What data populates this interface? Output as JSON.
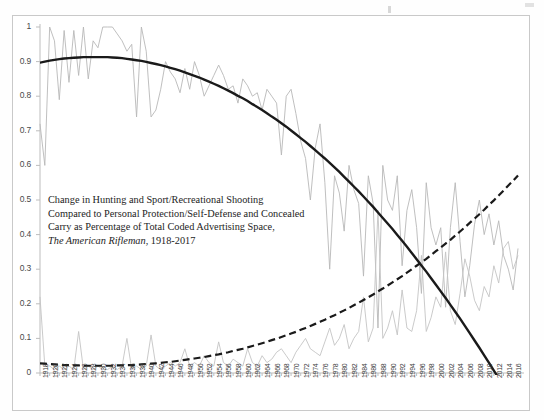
{
  "caption": {
    "line1": "Change in Hunting and Sport/Recreational Shooting",
    "line2": "Compared to Personal Protection/Self-Defense and Concealed",
    "line3": "Carry as Percentage of Total Coded Advertising Space,",
    "line4_italic": "The American Rifleman",
    "line4_rest": ", 1918-2017"
  },
  "chart_data": {
    "type": "line",
    "xlabel": "",
    "ylabel": "",
    "ylim": [
      0,
      1
    ],
    "xlim": [
      1918,
      2017
    ],
    "grid": false,
    "legend_position": "none",
    "ytick_labels": [
      "0",
      "0.1",
      "0.2",
      "0.3",
      "0.4",
      "0.5",
      "0.6",
      "0.7",
      "0.8",
      "0.9",
      "1"
    ],
    "ytick_values": [
      0,
      0.1,
      0.2,
      0.3,
      0.4,
      0.5,
      0.6,
      0.7,
      0.8,
      0.9,
      1
    ],
    "xtick_labels": [
      "1918",
      "1920",
      "1922",
      "1924",
      "1926",
      "1928",
      "1930",
      "1932",
      "1934",
      "1936",
      "1938",
      "1940",
      "1942",
      "1944",
      "1946",
      "1948",
      "1950",
      "1952",
      "1954",
      "1956",
      "1958",
      "1960",
      "1962",
      "1964",
      "1966",
      "1968",
      "1970",
      "1972",
      "1974",
      "1976",
      "1978",
      "1980",
      "1982",
      "1984",
      "1986",
      "1988",
      "1990",
      "1992",
      "1994",
      "1996",
      "1998",
      "2000",
      "2002",
      "2004",
      "2006",
      "2008",
      "2010",
      "2012",
      "2014",
      "2016"
    ],
    "x": [
      1918,
      1919,
      1920,
      1921,
      1922,
      1923,
      1924,
      1925,
      1926,
      1927,
      1928,
      1929,
      1930,
      1931,
      1932,
      1933,
      1934,
      1935,
      1936,
      1937,
      1938,
      1939,
      1940,
      1941,
      1942,
      1943,
      1944,
      1945,
      1946,
      1947,
      1948,
      1949,
      1950,
      1951,
      1952,
      1953,
      1954,
      1955,
      1956,
      1957,
      1958,
      1959,
      1960,
      1961,
      1962,
      1963,
      1964,
      1965,
      1966,
      1967,
      1968,
      1969,
      1970,
      1971,
      1972,
      1973,
      1974,
      1975,
      1976,
      1977,
      1978,
      1979,
      1980,
      1981,
      1982,
      1983,
      1984,
      1985,
      1986,
      1987,
      1988,
      1989,
      1990,
      1991,
      1992,
      1993,
      1994,
      1995,
      1996,
      1997,
      1998,
      1999,
      2000,
      2001,
      2002,
      2003,
      2004,
      2005,
      2006,
      2007,
      2008,
      2009,
      2010,
      2011,
      2012,
      2013,
      2014,
      2015,
      2016,
      2017
    ],
    "series": [
      {
        "name": "Hunting and Sport/Recreational Shooting",
        "style": "thin-solid-grey",
        "color": "#b8b8b8",
        "values": [
          0.72,
          0.6,
          1.0,
          0.96,
          0.79,
          0.99,
          0.84,
          0.99,
          0.86,
          1.0,
          0.85,
          0.96,
          0.94,
          1.0,
          1.0,
          1.0,
          0.98,
          0.96,
          0.93,
          0.95,
          0.74,
          1.0,
          0.93,
          0.74,
          0.76,
          0.82,
          0.9,
          0.87,
          0.85,
          0.81,
          0.88,
          0.82,
          0.9,
          0.86,
          0.8,
          0.83,
          0.86,
          0.89,
          0.86,
          0.82,
          0.83,
          0.78,
          0.85,
          0.83,
          0.8,
          0.81,
          0.76,
          0.82,
          0.8,
          0.78,
          0.63,
          0.8,
          0.82,
          0.75,
          0.67,
          0.62,
          0.5,
          0.65,
          0.72,
          0.55,
          0.3,
          0.57,
          0.52,
          0.41,
          0.6,
          0.53,
          0.49,
          0.28,
          0.57,
          0.49,
          0.13,
          0.6,
          0.5,
          0.47,
          0.57,
          0.31,
          0.47,
          0.53,
          0.42,
          0.23,
          0.55,
          0.42,
          0.37,
          0.42,
          0.19,
          0.42,
          0.55,
          0.38,
          0.22,
          0.31,
          0.43,
          0.5,
          0.4,
          0.46,
          0.37,
          0.44,
          0.34,
          0.3,
          0.24,
          0.36
        ]
      },
      {
        "name": "Personal Protection/Self-Defense and Concealed Carry",
        "style": "thin-solid-grey",
        "color": "#c4c4c4",
        "values": [
          0.22,
          0.02,
          0.02,
          0.01,
          0.02,
          0.01,
          0.02,
          0.01,
          0.12,
          0.01,
          0.02,
          0.01,
          0.02,
          0.01,
          0.01,
          0.02,
          0.01,
          0.02,
          0.1,
          0.01,
          0.02,
          0.01,
          0.02,
          0.11,
          0.02,
          0.01,
          0.02,
          0.03,
          0.02,
          0.03,
          0.07,
          0.02,
          0.03,
          0.02,
          0.05,
          0.03,
          0.02,
          0.09,
          0.03,
          0.02,
          0.04,
          0.03,
          0.02,
          0.07,
          0.03,
          0.02,
          0.05,
          0.03,
          0.04,
          0.06,
          0.07,
          0.05,
          0.03,
          0.06,
          0.08,
          0.1,
          0.07,
          0.06,
          0.05,
          0.09,
          0.13,
          0.08,
          0.1,
          0.14,
          0.07,
          0.1,
          0.12,
          0.22,
          0.09,
          0.13,
          0.47,
          0.1,
          0.13,
          0.18,
          0.11,
          0.24,
          0.13,
          0.12,
          0.18,
          0.34,
          0.12,
          0.16,
          0.22,
          0.19,
          0.35,
          0.18,
          0.14,
          0.23,
          0.33,
          0.28,
          0.21,
          0.18,
          0.25,
          0.22,
          0.31,
          0.26,
          0.36,
          0.38,
          0.3,
          0.34
        ]
      },
      {
        "name": "Hunting and Sport trendline (polynomial)",
        "style": "thick-solid-black",
        "color": "#1a1a1a",
        "values": [
          0.897,
          0.9,
          0.903,
          0.905,
          0.907,
          0.909,
          0.91,
          0.911,
          0.912,
          0.913,
          0.913,
          0.913,
          0.913,
          0.913,
          0.913,
          0.912,
          0.911,
          0.91,
          0.908,
          0.906,
          0.904,
          0.902,
          0.899,
          0.896,
          0.893,
          0.89,
          0.886,
          0.882,
          0.878,
          0.874,
          0.869,
          0.864,
          0.859,
          0.854,
          0.848,
          0.842,
          0.836,
          0.83,
          0.823,
          0.816,
          0.809,
          0.801,
          0.794,
          0.786,
          0.777,
          0.769,
          0.76,
          0.751,
          0.741,
          0.732,
          0.722,
          0.712,
          0.701,
          0.69,
          0.679,
          0.668,
          0.656,
          0.644,
          0.632,
          0.62,
          0.607,
          0.594,
          0.581,
          0.567,
          0.553,
          0.539,
          0.525,
          0.51,
          0.495,
          0.48,
          0.464,
          0.448,
          0.432,
          0.416,
          0.399,
          0.382,
          0.365,
          0.347,
          0.329,
          0.311,
          0.293,
          0.274,
          0.255,
          0.236,
          0.217,
          0.197,
          0.177,
          0.157,
          0.136,
          0.115,
          0.094,
          0.073,
          0.051,
          0.029,
          0.007,
          -0.015,
          -0.038,
          -0.061,
          -0.085,
          -0.109
        ]
      },
      {
        "name": "Personal Protection trendline (polynomial)",
        "style": "dashed-black",
        "color": "#1a1a1a",
        "values": [
          0.028,
          0.027,
          0.026,
          0.025,
          0.024,
          0.023,
          0.023,
          0.022,
          0.022,
          0.021,
          0.021,
          0.021,
          0.021,
          0.021,
          0.021,
          0.021,
          0.022,
          0.022,
          0.023,
          0.023,
          0.024,
          0.025,
          0.026,
          0.027,
          0.028,
          0.029,
          0.031,
          0.032,
          0.034,
          0.036,
          0.038,
          0.04,
          0.042,
          0.044,
          0.046,
          0.049,
          0.052,
          0.054,
          0.057,
          0.06,
          0.064,
          0.067,
          0.07,
          0.074,
          0.078,
          0.082,
          0.086,
          0.09,
          0.095,
          0.099,
          0.104,
          0.109,
          0.114,
          0.119,
          0.125,
          0.13,
          0.136,
          0.142,
          0.148,
          0.154,
          0.161,
          0.167,
          0.174,
          0.181,
          0.188,
          0.196,
          0.203,
          0.211,
          0.219,
          0.227,
          0.236,
          0.244,
          0.253,
          0.262,
          0.271,
          0.28,
          0.29,
          0.3,
          0.31,
          0.32,
          0.33,
          0.341,
          0.352,
          0.363,
          0.374,
          0.385,
          0.397,
          0.409,
          0.421,
          0.434,
          0.446,
          0.459,
          0.472,
          0.486,
          0.499,
          0.513,
          0.527,
          0.542,
          0.556,
          0.571
        ]
      }
    ]
  },
  "axis": {
    "y_min_label": "0",
    "y_max_label": "1"
  }
}
